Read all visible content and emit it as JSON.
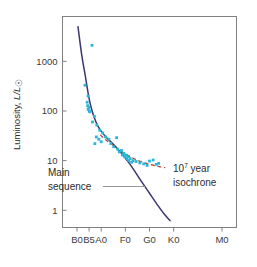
{
  "chart_data": {
    "type": "scatter",
    "title": "",
    "xlabel": "",
    "ylabel": "Luminosity, L/L⊙",
    "ylabel_parts": {
      "prefix": "Luminosity, ",
      "symbol": "L/L",
      "sun": "☉"
    },
    "x_tick_labels": [
      "B0",
      "B5",
      "A0",
      "F0",
      "G0",
      "K0",
      "M0"
    ],
    "x_tick_positions": [
      0,
      5,
      10,
      20,
      30,
      40,
      60
    ],
    "x_axis_type": "spectral-class",
    "xlim": [
      -6,
      66
    ],
    "y_tick_labels": [
      "1000",
      "100",
      "10",
      "1"
    ],
    "y_tick_values": [
      1000,
      100,
      10,
      1
    ],
    "yscale": "log",
    "ylim": [
      0.45,
      8000
    ],
    "grid": false,
    "legend_position": "none",
    "series": [
      {
        "name": "Cluster stars",
        "kind": "scatter",
        "color": "#29b6d8",
        "marker": "square",
        "points": [
          [
            6.2,
            2100
          ],
          [
            3.3,
            330
          ],
          [
            4.6,
            200
          ],
          [
            4.2,
            150
          ],
          [
            4.4,
            128
          ],
          [
            4.9,
            118
          ],
          [
            4.6,
            108
          ],
          [
            5.1,
            100
          ],
          [
            5.3,
            96
          ],
          [
            7.2,
            78
          ],
          [
            6.4,
            60
          ],
          [
            8.2,
            52
          ],
          [
            9.4,
            41
          ],
          [
            10.6,
            36
          ],
          [
            8.0,
            30
          ],
          [
            9.0,
            27
          ],
          [
            7.4,
            22
          ],
          [
            10.0,
            24
          ],
          [
            11.8,
            30
          ],
          [
            13.2,
            27
          ],
          [
            16.4,
            29
          ],
          [
            14.0,
            22
          ],
          [
            15.2,
            19
          ],
          [
            16.8,
            17
          ],
          [
            18.4,
            16
          ],
          [
            17.5,
            15
          ],
          [
            19.4,
            14
          ],
          [
            18.8,
            13
          ],
          [
            20.2,
            13
          ],
          [
            19.8,
            12
          ],
          [
            21.0,
            12
          ],
          [
            20.6,
            11
          ],
          [
            22.0,
            11
          ],
          [
            21.4,
            10
          ],
          [
            23.2,
            10
          ],
          [
            22.6,
            9.3
          ],
          [
            24.5,
            9.6
          ],
          [
            26.0,
            9.0
          ],
          [
            27.6,
            8.6
          ],
          [
            30.0,
            9.8
          ],
          [
            31.5,
            10.3
          ],
          [
            32.8,
            8.4
          ],
          [
            29.0,
            8.0
          ],
          [
            33.8,
            8.8
          ]
        ]
      },
      {
        "name": "Main sequence",
        "kind": "line",
        "color": "#3b3570",
        "style": "solid",
        "points": [
          [
            0.4,
            5000
          ],
          [
            2.0,
            1300
          ],
          [
            3.4,
            520
          ],
          [
            4.6,
            230
          ],
          [
            5.8,
            120
          ],
          [
            7.2,
            72
          ],
          [
            8.6,
            50
          ],
          [
            10.2,
            38
          ],
          [
            12.0,
            30
          ],
          [
            14.0,
            24
          ],
          [
            16.5,
            18
          ],
          [
            19.0,
            13
          ],
          [
            21.5,
            9.0
          ],
          [
            24.0,
            6.0
          ],
          [
            27.0,
            3.6
          ],
          [
            30.0,
            2.2
          ],
          [
            33.0,
            1.35
          ],
          [
            36.0,
            0.85
          ],
          [
            38.5,
            0.62
          ]
        ]
      },
      {
        "name": "10^7 year isochrone",
        "kind": "line",
        "color": "#b03a2e",
        "style": "dashed",
        "points": [
          [
            9.6,
            33
          ],
          [
            12.0,
            26
          ],
          [
            14.5,
            21
          ],
          [
            17.0,
            17
          ],
          [
            19.5,
            14.2
          ],
          [
            22.0,
            12.0
          ],
          [
            25.0,
            10.2
          ],
          [
            28.0,
            9.0
          ],
          [
            31.0,
            8.2
          ],
          [
            34.0,
            7.6
          ],
          [
            36.5,
            7.2
          ]
        ]
      }
    ],
    "annotations": [
      {
        "id": "main-sequence-label",
        "line1": "Main",
        "line2": "sequence",
        "has_leader_line": true,
        "leader_color": "#999999"
      },
      {
        "id": "isochrone-label",
        "base": "10",
        "exponent": "7",
        "line1_suffix": " year",
        "line2": "isochrone"
      }
    ]
  },
  "colors": {
    "frame": "#808080",
    "data_point": "#29b6d8",
    "main_sequence": "#3b3570",
    "isochrone": "#b03a2e",
    "text": "#2b2b2b",
    "leader": "#999999",
    "background": "#ffffff"
  }
}
